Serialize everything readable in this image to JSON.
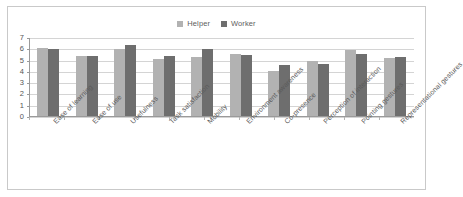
{
  "chart_data": {
    "type": "bar",
    "title": "",
    "subtitle": "",
    "xlabel": "",
    "ylabel": "",
    "ylim": [
      0,
      7
    ],
    "yticks": [
      0,
      1,
      2,
      3,
      4,
      5,
      6,
      7
    ],
    "grid": true,
    "legend_position": "top-center",
    "categories": [
      "Ease of learning",
      "Ease of use",
      "Usefulness",
      "Task satisfaction",
      "Mobility",
      "Environment awareness",
      "Co-presence",
      "Perception of interaction",
      "Pointing gestures",
      "Representational gestures"
    ],
    "series": [
      {
        "name": "Helper",
        "color": "#b2b2b2",
        "values": [
          6.1,
          5.45,
          6.0,
          5.15,
          5.35,
          5.55,
          4.1,
          5.0,
          5.95,
          5.2
        ]
      },
      {
        "name": "Worker",
        "color": "#6e6e6e",
        "values": [
          6.05,
          5.45,
          6.35,
          5.4,
          6.05,
          5.5,
          4.6,
          4.7,
          5.55,
          5.3
        ]
      }
    ]
  },
  "legend": {
    "entries": [
      {
        "label": "Helper",
        "color": "#b2b2b2"
      },
      {
        "label": "Worker",
        "color": "#6e6e6e"
      }
    ]
  },
  "axis": {
    "y_tick_labels": [
      "7",
      "6",
      "5",
      "4",
      "3",
      "2",
      "1",
      "0"
    ]
  }
}
